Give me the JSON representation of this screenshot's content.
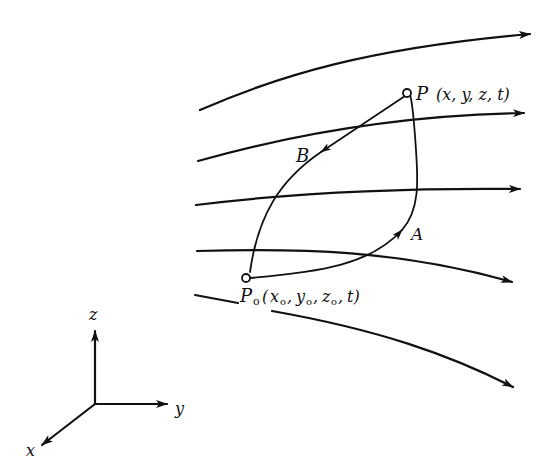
{
  "figure": {
    "type": "streamline-path-diagram",
    "background": "#ffffff",
    "ink_color": "#111111"
  },
  "labels": {
    "point_p": "P",
    "point_p_coords": "(x, y, z, t)",
    "point_p0": "P",
    "point_p0_subscript": "o",
    "point_p0_coords_open": "(",
    "point_p0_x": "x",
    "point_p0_y": "y",
    "point_p0_z": "z",
    "point_p0_t": "t)",
    "sub_o": "o",
    "path_a": "A",
    "path_b": "B"
  },
  "axes": {
    "x_label": "x",
    "y_label": "y",
    "z_label": "z"
  },
  "streamlines": [
    {
      "id": "streamline-1",
      "direction": "right"
    },
    {
      "id": "streamline-2",
      "direction": "right"
    },
    {
      "id": "streamline-3",
      "direction": "right"
    },
    {
      "id": "streamline-4",
      "direction": "right-down"
    },
    {
      "id": "streamline-5",
      "direction": "right-down"
    }
  ],
  "paths": [
    {
      "id": "path-a",
      "from": "P0",
      "to": "P",
      "label": "A"
    },
    {
      "id": "path-b",
      "from": "P",
      "to": "P0",
      "label": "B"
    }
  ]
}
